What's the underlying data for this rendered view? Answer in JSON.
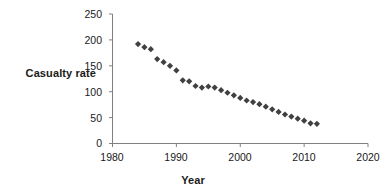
{
  "chart_data": {
    "type": "scatter",
    "title": "",
    "xlabel": "Year",
    "ylabel": "Casualty rate",
    "xlim": [
      1980,
      2020
    ],
    "ylim": [
      0,
      250
    ],
    "xticks": [
      1980,
      1990,
      2000,
      2010,
      2020
    ],
    "yticks": [
      0,
      50,
      100,
      150,
      200,
      250
    ],
    "xtick_labels": [
      "1980",
      "1990",
      "2000",
      "2010",
      "2020"
    ],
    "ytick_labels": [
      "0",
      "50",
      "100",
      "150",
      "200",
      "250"
    ],
    "grid": false,
    "legend": null,
    "marker": "diamond",
    "marker_color": "#404040",
    "series": [
      {
        "name": "Casualty rate",
        "x": [
          1984,
          1985,
          1986,
          1987,
          1988,
          1989,
          1990,
          1991,
          1992,
          1993,
          1994,
          1995,
          1996,
          1997,
          1998,
          1999,
          2000,
          2001,
          2002,
          2003,
          2004,
          2005,
          2006,
          2007,
          2008,
          2009,
          2010,
          2011,
          2012
        ],
        "values": [
          192,
          186,
          182,
          163,
          157,
          150,
          141,
          122,
          120,
          111,
          108,
          110,
          108,
          103,
          98,
          93,
          88,
          83,
          80,
          76,
          71,
          66,
          61,
          56,
          52,
          48,
          44,
          39,
          38
        ]
      }
    ]
  },
  "axis": {
    "x_axis_name": "year-axis",
    "y_axis_name": "casualty-rate-axis"
  }
}
